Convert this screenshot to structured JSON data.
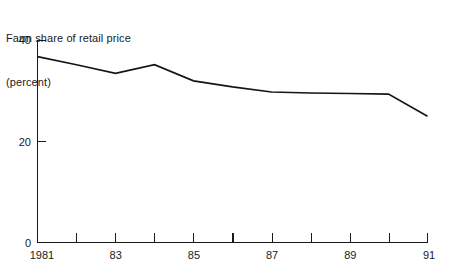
{
  "chart_data": {
    "type": "line",
    "title": "Farm share of retail price",
    "subtitle": "(percent)",
    "xlabel": "",
    "ylabel": "",
    "ylim": [
      0,
      40
    ],
    "yticks": [
      0,
      20,
      40
    ],
    "ytick_labels": [
      "0",
      "20",
      "40"
    ],
    "xlim": [
      1981,
      1991
    ],
    "xticks": [
      1981,
      1982,
      1983,
      1984,
      1985,
      1986,
      1987,
      1988,
      1989,
      1990,
      1991
    ],
    "xtick_labels": [
      "1981",
      "",
      "83",
      "",
      "85",
      "",
      "87",
      "",
      "89",
      "",
      "91"
    ],
    "grid": false,
    "legend": false,
    "x": [
      1981,
      1982,
      1983,
      1984,
      1985,
      1986,
      1987,
      1988,
      1989,
      1990,
      1991
    ],
    "values": [
      36.8,
      35.2,
      33.5,
      35.2,
      32.0,
      30.8,
      29.8,
      29.6,
      29.5,
      29.4,
      25.0
    ],
    "series": [
      {
        "name": "Farm share of retail price",
        "color": "#151515",
        "values": [
          36.8,
          35.2,
          33.5,
          35.2,
          32.0,
          30.8,
          29.8,
          29.6,
          29.5,
          29.4,
          25.0
        ]
      }
    ]
  },
  "title_lines": {
    "line1": "Farm share of retail price",
    "line2": "(percent)"
  },
  "axis_labels": {
    "y_top": "40",
    "y_mid": "20",
    "y_zero": "0",
    "x_1981": "1981",
    "x_83": "83",
    "x_85": "85",
    "x_87": "87",
    "x_89": "89",
    "x_91": "91"
  }
}
